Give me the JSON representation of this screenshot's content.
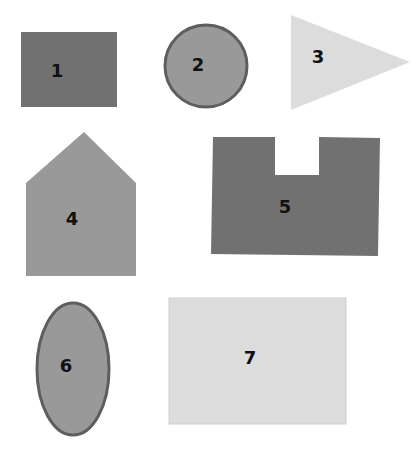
{
  "colors": {
    "dark": "#717171",
    "medium": "#999999",
    "medium_stroke": "#5e5e5e",
    "light": "#dcdcdc",
    "light_border": "#cfcfcf"
  },
  "shapes": [
    {
      "id": 1,
      "label": "1",
      "type": "rectangle",
      "shade": "dark"
    },
    {
      "id": 2,
      "label": "2",
      "type": "circle",
      "shade": "medium"
    },
    {
      "id": 3,
      "label": "3",
      "type": "triangle",
      "shade": "light"
    },
    {
      "id": 4,
      "label": "4",
      "type": "pentagon-house",
      "shade": "medium"
    },
    {
      "id": 5,
      "label": "5",
      "type": "notched-rectangle",
      "shade": "dark"
    },
    {
      "id": 6,
      "label": "6",
      "type": "ellipse",
      "shade": "medium"
    },
    {
      "id": 7,
      "label": "7",
      "type": "rectangle",
      "shade": "light"
    }
  ]
}
